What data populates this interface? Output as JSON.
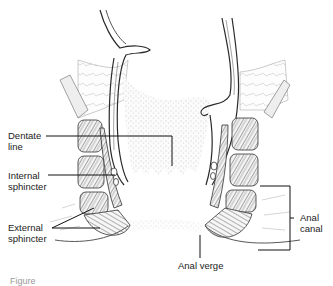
{
  "diagram": {
    "style": "grayscale anatomical line drawing",
    "labels": {
      "dentate_line": "Dentate\nline",
      "internal_sphincter": "Internal\nsphincter",
      "external_sphincter": "External\nsphincter",
      "anal_canal": "Anal\ncanal",
      "anal_verge": "Anal verge"
    },
    "caption": "Figure"
  },
  "colors": {
    "line": "#2a2a2a",
    "stipple": "#9a9a9a",
    "background": "#ffffff"
  }
}
